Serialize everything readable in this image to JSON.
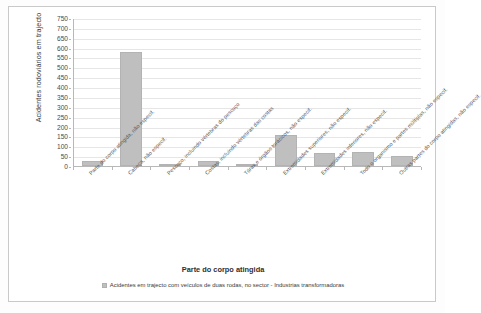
{
  "chart_data": {
    "type": "bar",
    "title": "",
    "xlabel": "Parte do corpo atingida",
    "ylabel": "Acidentes rodoviários em trajecto",
    "ylim": [
      0,
      750
    ],
    "ytick_step": 50,
    "grid": true,
    "legend_position": "bottom",
    "bar_color": "#bfbfbf",
    "categories": [
      "Parte do corpo atingida, não especif.",
      "Cabeça, não especif.",
      "Pescoço, incluindo vértebras do pescoço",
      "Costas, incluindo vértebras das costas",
      "Tórax e órgãos torácicos, não especif.",
      "Extremidades superiores, não especif.",
      "Extremidades inferiores, não especif.",
      "Todo o organismo e partes múltiplas, não especif.",
      "Outras partes do corpo atingidas, não especif."
    ],
    "series": [
      {
        "name": "Acidentes em trajecto com veículos de duas rodas, no sector - Industrias transformadoras",
        "values": [
          25,
          580,
          0,
          25,
          5,
          155,
          65,
          70,
          50
        ]
      }
    ],
    "yticks": [
      "750",
      "700",
      "650",
      "600",
      "550",
      "500",
      "450",
      "400",
      "350",
      "300",
      "250",
      "200",
      "150",
      "100",
      "50",
      "0"
    ]
  },
  "legend": {
    "entries": [
      {
        "label": "Acidentes em trajecto com veículos de duas rodas, no sector - Industrias transformadoras",
        "color": "#bfbfbf"
      }
    ]
  }
}
